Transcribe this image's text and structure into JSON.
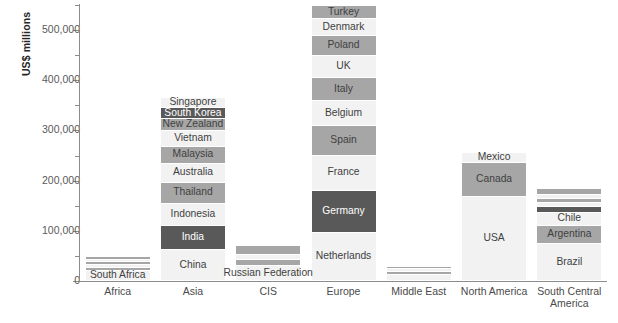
{
  "chart_data": {
    "type": "bar",
    "subtype": "stacked-bar",
    "title": "",
    "xlabel": "",
    "ylabel": "US$ millions",
    "ylim": [
      0,
      550000
    ],
    "ytick_labels": [
      "0",
      "100,000",
      "200,000",
      "300,000",
      "400,000",
      "500,000"
    ],
    "ytick_values": [
      0,
      100000,
      200000,
      300000,
      400000,
      500000
    ],
    "minor_tick_values": [
      50000,
      150000,
      250000,
      350000,
      450000,
      550000
    ],
    "grid": false,
    "legend": "none (segments labelled in place)",
    "categories": [
      "Africa",
      "Asia",
      "CIS",
      "Europe",
      "Middle East",
      "North America",
      "South Central America"
    ],
    "totals": [
      48000,
      365000,
      70000,
      548000,
      28000,
      256000,
      183000
    ],
    "series": [
      {
        "category": "Africa",
        "total": 48000,
        "segments": [
          {
            "name": "South Africa",
            "value": 20000,
            "shade": "light"
          },
          {
            "name": "",
            "value": 6000,
            "shade": "mid"
          },
          {
            "name": "",
            "value": 5000,
            "shade": "light"
          },
          {
            "name": "",
            "value": 6000,
            "shade": "mid"
          },
          {
            "name": "",
            "value": 5000,
            "shade": "light"
          },
          {
            "name": "",
            "value": 6000,
            "shade": "mid"
          }
        ]
      },
      {
        "category": "Asia",
        "total": 365000,
        "segments": [
          {
            "name": "China",
            "value": 62000,
            "shade": "light"
          },
          {
            "name": "India",
            "value": 48000,
            "shade": "dark"
          },
          {
            "name": "Indonesia",
            "value": 44000,
            "shade": "light"
          },
          {
            "name": "Thailand",
            "value": 42000,
            "shade": "mid"
          },
          {
            "name": "Australia",
            "value": 38000,
            "shade": "light"
          },
          {
            "name": "Malaysia",
            "value": 34000,
            "shade": "mid"
          },
          {
            "name": "Vietnam",
            "value": 32000,
            "shade": "light"
          },
          {
            "name": "New Zealand",
            "value": 23000,
            "shade": "mid"
          },
          {
            "name": "South Korea",
            "value": 21000,
            "shade": "dark"
          },
          {
            "name": "Singapore",
            "value": 21000,
            "shade": "light"
          }
        ]
      },
      {
        "category": "CIS",
        "total": 70000,
        "segments": [
          {
            "name": "Russian Federation",
            "value": 30000,
            "shade": "light"
          },
          {
            "name": "",
            "value": 12000,
            "shade": "mid"
          },
          {
            "name": "",
            "value": 10000,
            "shade": "light"
          },
          {
            "name": "",
            "value": 18000,
            "shade": "mid"
          }
        ]
      },
      {
        "category": "Europe",
        "total": 548000,
        "segments": [
          {
            "name": "Netherlands",
            "value": 96000,
            "shade": "light"
          },
          {
            "name": "Germany",
            "value": 84000,
            "shade": "dark"
          },
          {
            "name": "France",
            "value": 70000,
            "shade": "light"
          },
          {
            "name": "Spain",
            "value": 58000,
            "shade": "mid"
          },
          {
            "name": "Belgium",
            "value": 50000,
            "shade": "light"
          },
          {
            "name": "Italy",
            "value": 46000,
            "shade": "mid"
          },
          {
            "name": "UK",
            "value": 44000,
            "shade": "light"
          },
          {
            "name": "Poland",
            "value": 40000,
            "shade": "mid"
          },
          {
            "name": "Denmark",
            "value": 34000,
            "shade": "light"
          },
          {
            "name": "Turkey",
            "value": 26000,
            "shade": "mid"
          }
        ]
      },
      {
        "category": "Middle East",
        "total": 28000,
        "segments": [
          {
            "name": "",
            "value": 12000,
            "shade": "light"
          },
          {
            "name": "",
            "value": 6000,
            "shade": "mid"
          },
          {
            "name": "",
            "value": 5000,
            "shade": "light"
          },
          {
            "name": "",
            "value": 5000,
            "shade": "mid"
          }
        ]
      },
      {
        "category": "North America",
        "total": 256000,
        "segments": [
          {
            "name": "USA",
            "value": 168000,
            "shade": "light"
          },
          {
            "name": "Canada",
            "value": 68000,
            "shade": "mid"
          },
          {
            "name": "Mexico",
            "value": 20000,
            "shade": "light"
          }
        ]
      },
      {
        "category": "South Central America",
        "total": 183000,
        "segments": [
          {
            "name": "Brazil",
            "value": 74000,
            "shade": "light"
          },
          {
            "name": "Argentina",
            "value": 36000,
            "shade": "mid"
          },
          {
            "name": "Chile",
            "value": 26000,
            "shade": "light"
          },
          {
            "name": "",
            "value": 12000,
            "shade": "dark"
          },
          {
            "name": "",
            "value": 7000,
            "shade": "light"
          },
          {
            "name": "",
            "value": 9000,
            "shade": "mid"
          },
          {
            "name": "",
            "value": 7000,
            "shade": "light"
          },
          {
            "name": "",
            "value": 12000,
            "shade": "mid"
          }
        ]
      }
    ]
  },
  "colors": {
    "light": "#f2f2f2",
    "mid": "#a6a6a6",
    "dark": "#595959",
    "axis": "#8c8c8c",
    "text_light": "#ffffff",
    "text_dark": "#3f3f3f",
    "background": "#ffffff"
  }
}
